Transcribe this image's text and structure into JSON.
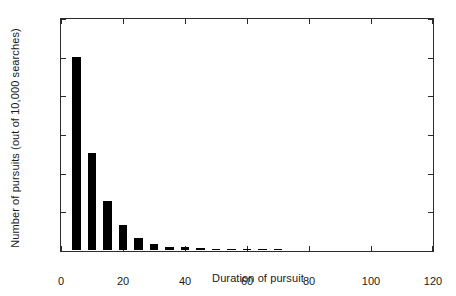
{
  "chart_data": {
    "type": "bar",
    "title": "",
    "subtitle": "",
    "xlabel": "Duration of pursuit",
    "ylabel": "Number of pursuits (out of 10,000 searches)",
    "xlim": [
      0,
      120
    ],
    "ylim": [
      0,
      6000
    ],
    "xticks": [
      0,
      20,
      40,
      60,
      80,
      100,
      120
    ],
    "yticks": [
      0,
      1000,
      2000,
      3000,
      4000,
      5000,
      6000
    ],
    "xtick_labels": [
      "0",
      "20",
      "40",
      "60",
      "80",
      "100",
      "120"
    ],
    "ytick_labels": [
      "0",
      "1000",
      "2000",
      "3000",
      "4000",
      "5000",
      "6000"
    ],
    "grid": false,
    "legend": null,
    "bar_color": "#000000",
    "frame_color": "#2b2b2b",
    "background": "#ffffff",
    "bar_width": 5,
    "categories": [
      5,
      10,
      15,
      20,
      25,
      30,
      35,
      40,
      45,
      50,
      55,
      60,
      65,
      70
    ],
    "values": [
      5000,
      2500,
      1280,
      640,
      300,
      165,
      90,
      75,
      45,
      35,
      30,
      35,
      20,
      25
    ]
  }
}
